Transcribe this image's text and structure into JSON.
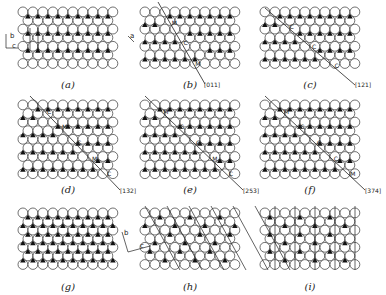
{
  "figure": {
    "panels": [
      {
        "id": "a",
        "caption": "(a)",
        "x": 18,
        "y": 7,
        "cols": 10,
        "rows": 7,
        "pattern": "rows-alt",
        "line": null,
        "dir_label": "",
        "markers": []
      },
      {
        "id": "b",
        "caption": "(b)",
        "x": 140,
        "y": 7,
        "cols": 10,
        "rows": 7,
        "pattern": "step-b",
        "line": {
          "x1": 158,
          "y1": 2,
          "x2": 205,
          "y2": 84
        },
        "dir_label": "[011]",
        "markers": [
          "M",
          "C",
          "M"
        ]
      },
      {
        "id": "c",
        "caption": "(c)",
        "x": 260,
        "y": 7,
        "cols": 10,
        "rows": 7,
        "pattern": "step-c",
        "line": {
          "x1": 265,
          "y1": 8,
          "x2": 355,
          "y2": 85
        },
        "dir_label": "[121]",
        "markers": [
          "C",
          "C",
          "C"
        ]
      },
      {
        "id": "d",
        "caption": "(d)",
        "x": 18,
        "y": 100,
        "cols": 10,
        "rows": 9,
        "pattern": "step-d",
        "line": {
          "x1": 30,
          "y1": 96,
          "x2": 120,
          "y2": 190
        },
        "dir_label": "[132]",
        "markers": [
          "C",
          "M",
          "C",
          "M",
          "C"
        ]
      },
      {
        "id": "e",
        "caption": "(e)",
        "x": 140,
        "y": 100,
        "cols": 10,
        "rows": 9,
        "pattern": "step-e",
        "line": {
          "x1": 145,
          "y1": 96,
          "x2": 243,
          "y2": 190
        },
        "dir_label": "[253]",
        "markers": [
          "M",
          "C",
          "C",
          "M",
          "C"
        ]
      },
      {
        "id": "f",
        "caption": "(f)",
        "x": 260,
        "y": 100,
        "cols": 10,
        "rows": 9,
        "pattern": "step-f",
        "line": {
          "x1": 265,
          "y1": 96,
          "x2": 365,
          "y2": 190
        },
        "dir_label": "[374]",
        "markers": [
          "M",
          "C",
          "C",
          "C",
          "M"
        ]
      },
      {
        "id": "g",
        "caption": "(g)",
        "x": 18,
        "y": 208,
        "cols": 10,
        "rows": 7,
        "pattern": "all",
        "line": null,
        "dir_label": "",
        "markers": []
      },
      {
        "id": "h",
        "caption": "(h)",
        "x": 140,
        "y": 208,
        "cols": 10,
        "rows": 7,
        "pattern": "h",
        "line": null,
        "dir_label": "",
        "markers": []
      },
      {
        "id": "i",
        "caption": "(i)",
        "x": 260,
        "y": 208,
        "cols": 10,
        "rows": 7,
        "pattern": "i",
        "line": null,
        "dir_label": "",
        "markers": []
      }
    ],
    "axes_a": {
      "b": "b",
      "c": "c"
    },
    "axis_b_label": "a",
    "axes_h": {
      "b": "b",
      "c": "c"
    }
  },
  "colors": {
    "circle_stroke": "#333333",
    "triangle": "#111111",
    "background": "#ffffff"
  }
}
